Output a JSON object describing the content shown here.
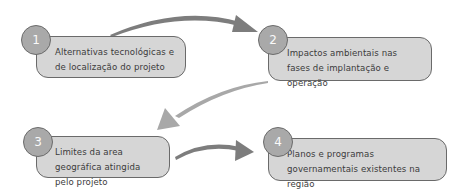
{
  "diagram": {
    "title": "",
    "steps": [
      {
        "number": "1",
        "label": "Alternativas tecnológicas e de localização do projeto"
      },
      {
        "number": "2",
        "label": "Impactos ambientais nas fases de implantação e operação"
      },
      {
        "number": "3",
        "label": "Limites da area geográfica atingida pelo projeto"
      },
      {
        "number": "4",
        "label": "Planos e programas governamentais existentes na região"
      }
    ],
    "connections": [
      {
        "from": "1",
        "to": "2"
      },
      {
        "from": "2",
        "to": "3"
      },
      {
        "from": "3",
        "to": "4"
      }
    ],
    "colors": {
      "box_fill": "#d6d6d6",
      "circle_fill": "#a9a9a9",
      "border": "#6a6a6a",
      "arrow": "#7a7a7a",
      "text": "#3b3b3b"
    }
  }
}
